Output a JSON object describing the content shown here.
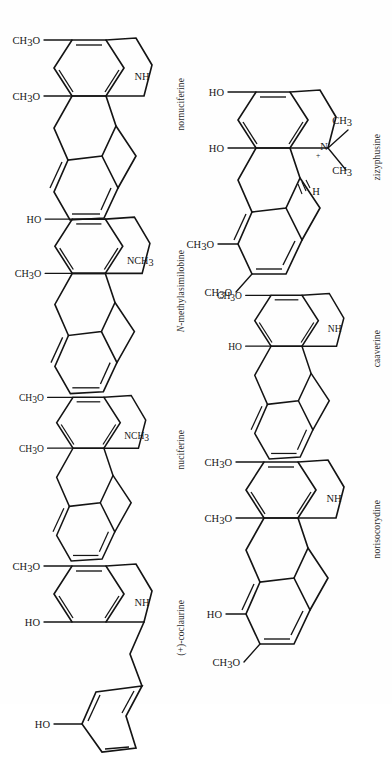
{
  "figure": {
    "type": "chemical-structure-plate",
    "orientation": "rotated-90-ccw",
    "background": "#fefefe",
    "ink": "#141414",
    "columns": 2,
    "structure_count": 8
  },
  "structures": [
    {
      "id": "nornuciferine",
      "name": "nornuciferine",
      "name_italic_prefix": "",
      "column": "left",
      "order": 1,
      "skeleton": "aporphine",
      "nitrogen_label": "NH",
      "substituents": [
        "CH3O",
        "CH3O"
      ],
      "substituent_labels": [
        "CH",
        "3",
        "O"
      ]
    },
    {
      "id": "n-methylasimilobine",
      "name": "-methylasimilobine",
      "name_italic_prefix": "N",
      "column": "left",
      "order": 2,
      "skeleton": "aporphine",
      "nitrogen_label": "NCH3",
      "substituents": [
        "HO",
        "CH3O"
      ]
    },
    {
      "id": "nuciferine",
      "name": "nuciferine",
      "name_italic_prefix": "",
      "column": "left",
      "order": 3,
      "skeleton": "aporphine",
      "nitrogen_label": "NCH3",
      "substituents": [
        "CH3O",
        "CH3O"
      ]
    },
    {
      "id": "coclaurine",
      "name": "(+)-coclaurine",
      "name_italic_prefix": "",
      "column": "left",
      "order": 4,
      "skeleton": "benzylisoquinoline",
      "nitrogen_label": "NH",
      "substituents": [
        "CH3O",
        "HO",
        "HO"
      ]
    },
    {
      "id": "zizyphusine",
      "name": "zizyphusine",
      "name_italic_prefix": "",
      "column": "right",
      "order": 1,
      "skeleton": "aporphine",
      "nitrogen_label": "N",
      "nitrogen_charge": "+",
      "n_methyls": [
        "CH3",
        "CH3"
      ],
      "stereo_h": "H",
      "substituents": [
        "HO",
        "HO",
        "CH3O",
        "CH3O"
      ]
    },
    {
      "id": "caaverine",
      "name": "caaverine",
      "name_italic_prefix": "",
      "column": "right",
      "order": 2,
      "skeleton": "aporphine",
      "nitrogen_label": "NH",
      "substituents": [
        "CH3O",
        "HO"
      ]
    },
    {
      "id": "norisocorydine",
      "name": "norisocorydine",
      "name_italic_prefix": "",
      "column": "right",
      "order": 3,
      "skeleton": "aporphine",
      "nitrogen_label": "NH",
      "substituents": [
        "CH3O",
        "CH3O",
        "HO",
        "CH3O"
      ]
    }
  ],
  "atom_labels": {
    "nh": "NH",
    "n": "N",
    "h": "H",
    "ch3": "CH",
    "ch3_sub": "3",
    "nch3": "NCH",
    "ho": "HO",
    "ch3o": "CH",
    "ch3o_sub": "3",
    "ch3o_tail": "O",
    "plus": "+"
  }
}
